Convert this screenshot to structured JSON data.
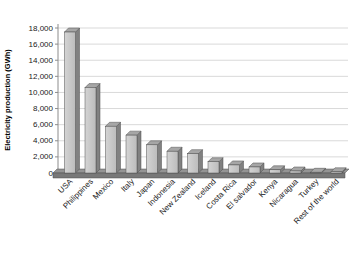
{
  "chart_data": {
    "type": "bar",
    "style": "3d-column-grayscale",
    "title": "",
    "xlabel": "",
    "ylabel": "Electricity production (GWh)",
    "categories": [
      "USA",
      "Philippines",
      "Mexico",
      "Italy",
      "Japan",
      "Indonesia",
      "New Zealand",
      "Iceland",
      "Costa Rica",
      "El salvador",
      "Kenya",
      "Nicaragua",
      "Turkey",
      "Rest of the world"
    ],
    "values": [
      17500,
      10600,
      5800,
      4700,
      3500,
      2700,
      2400,
      1400,
      1000,
      750,
      400,
      250,
      90,
      150
    ],
    "ylim": [
      0,
      18000
    ],
    "ytick_step": 2000,
    "ytick_labels": [
      "0",
      "2,000",
      "4,000",
      "6,000",
      "8,000",
      "10,000",
      "12,000",
      "14,000",
      "16,000",
      "18,000"
    ],
    "grid": true,
    "legend": false,
    "x_label_rotation_deg": -45
  },
  "colors": {
    "background": "#ffffff",
    "gridline": "#d9d9d9",
    "axis": "#8c8c8c",
    "text": "#1a1a1a",
    "bar_front_light": "#d4d4d4",
    "bar_front_dark": "#bcbcbc",
    "bar_top": "#a6a6a6",
    "bar_side": "#818181",
    "bar_outline": "#4f4f4f",
    "floor_top": "#949494",
    "floor_front": "#787878"
  }
}
